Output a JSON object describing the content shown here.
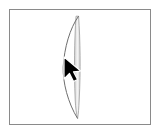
{
  "canvas": {
    "width": 160,
    "height": 134,
    "background_color": "#ffffff",
    "label": "drawing-canvas"
  },
  "frame": {
    "label": "canvas-frame",
    "x": 9,
    "y": 9,
    "width": 142,
    "height": 116,
    "border_color": "#8a8a8a",
    "border_width": 1,
    "fill_color": "#ffffff"
  },
  "shape": {
    "name": "vertical-lens-shape",
    "description": "narrow vertical crescent / edge-on ellipse",
    "bar": {
      "x_left": 74,
      "x_right": 81,
      "y_top": 16,
      "y_bottom": 118,
      "fill_color": "#dcdcdc",
      "highlight_color": "#f2f2f2",
      "edge_color": "#9e9e9e"
    },
    "arc": {
      "start_x": 79,
      "start_y": 16,
      "end_x": 77,
      "end_y": 118,
      "leftmost_x": 63,
      "leftmost_y": 67,
      "stroke_color": "#6e6e6e",
      "stroke_width": 1
    }
  },
  "cursor": {
    "name": "arrow-pointer",
    "tip_x": 64,
    "tip_y": 57,
    "fill_color": "#000000",
    "outline_color": "#ffffff",
    "width": 17,
    "height": 23
  }
}
